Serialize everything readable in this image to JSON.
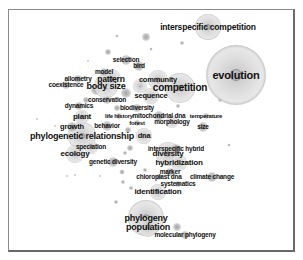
{
  "chart_data": {
    "type": "bubble-network",
    "title": "",
    "frame": {
      "x": 8,
      "y": 9,
      "width": 288,
      "height": 244
    },
    "colors": {
      "bubble_outer": "#e6e6e6",
      "bubble_inner": "#bdbdbd",
      "bubble_core": "#8c8c8c",
      "text": "#111111",
      "frame": "#7a7a7a"
    },
    "nodes": [
      {
        "label": "interspecific competition",
        "x": 208,
        "y": 27,
        "r": 13,
        "fs": 8.5
      },
      {
        "label": "evolution",
        "x": 236,
        "y": 75,
        "r": 30,
        "fs": 11
      },
      {
        "label": "competition",
        "x": 180,
        "y": 88,
        "r": 15,
        "fs": 10
      },
      {
        "label": "selection",
        "x": 126,
        "y": 60,
        "r": 5,
        "fs": 6.5
      },
      {
        "label": "bird",
        "x": 139,
        "y": 66,
        "r": 5,
        "fs": 6.5
      },
      {
        "label": "model",
        "x": 104,
        "y": 72,
        "r": 4,
        "fs": 6.5
      },
      {
        "label": "allometry",
        "x": 78,
        "y": 79,
        "r": 4,
        "fs": 6.5
      },
      {
        "label": "pattern",
        "x": 111,
        "y": 79,
        "r": 10,
        "fs": 8.5
      },
      {
        "label": "community",
        "x": 158,
        "y": 80,
        "r": 10,
        "fs": 7.5
      },
      {
        "label": "coexistence",
        "x": 66,
        "y": 85,
        "r": 4,
        "fs": 6.5
      },
      {
        "label": "body size",
        "x": 106,
        "y": 86,
        "r": 12,
        "fs": 9
      },
      {
        "label": "sequence",
        "x": 151,
        "y": 96,
        "r": 8,
        "fs": 7.5
      },
      {
        "label": "conservation",
        "x": 107,
        "y": 100,
        "r": 4,
        "fs": 6.5
      },
      {
        "label": "dynamics",
        "x": 79,
        "y": 106,
        "r": 4,
        "fs": 6.5
      },
      {
        "label": "biodiversity",
        "x": 137,
        "y": 108,
        "r": 4,
        "fs": 6.5
      },
      {
        "label": "plant",
        "x": 82,
        "y": 117,
        "r": 7,
        "fs": 8
      },
      {
        "label": "life history",
        "x": 119,
        "y": 116,
        "r": 3,
        "fs": 6
      },
      {
        "label": "mitochondrial dna",
        "x": 159,
        "y": 116,
        "r": 5,
        "fs": 6.5
      },
      {
        "label": "temperature",
        "x": 206,
        "y": 116,
        "r": 3,
        "fs": 6
      },
      {
        "label": "forest",
        "x": 137,
        "y": 123,
        "r": 3,
        "fs": 6
      },
      {
        "label": "morphology",
        "x": 172,
        "y": 122,
        "r": 6,
        "fs": 6.5
      },
      {
        "label": "behavior",
        "x": 107,
        "y": 126,
        "r": 5,
        "fs": 6.5
      },
      {
        "label": "size",
        "x": 203,
        "y": 127,
        "r": 5,
        "fs": 6.5
      },
      {
        "label": "growth",
        "x": 72,
        "y": 127,
        "r": 5,
        "fs": 7.5
      },
      {
        "label": "phylogenetic relationship",
        "x": 82,
        "y": 136,
        "r": 14,
        "fs": 9
      },
      {
        "label": "dna",
        "x": 144,
        "y": 136,
        "r": 8,
        "fs": 7.5
      },
      {
        "label": "speciation",
        "x": 91,
        "y": 147,
        "r": 7,
        "fs": 6.5
      },
      {
        "label": "interspecific hybrid",
        "x": 176,
        "y": 149,
        "r": 5,
        "fs": 6.5
      },
      {
        "label": "ecology",
        "x": 75,
        "y": 154,
        "r": 9,
        "fs": 8
      },
      {
        "label": "diversity",
        "x": 168,
        "y": 154,
        "r": 12,
        "fs": 8
      },
      {
        "label": "genetic diversity",
        "x": 113,
        "y": 162,
        "r": 5,
        "fs": 6.5
      },
      {
        "label": "hybridization",
        "x": 179,
        "y": 163,
        "r": 8,
        "fs": 8
      },
      {
        "label": "marker",
        "x": 170,
        "y": 172,
        "r": 4,
        "fs": 6.5
      },
      {
        "label": "chloroplast dna",
        "x": 159,
        "y": 177,
        "r": 3,
        "fs": 6.5
      },
      {
        "label": "climate change",
        "x": 212,
        "y": 177,
        "r": 5,
        "fs": 6.5
      },
      {
        "label": "systematics",
        "x": 178,
        "y": 184,
        "r": 3,
        "fs": 6.5
      },
      {
        "label": "identification",
        "x": 158,
        "y": 192,
        "r": 8,
        "fs": 8
      },
      {
        "label": "phylogeny",
        "x": 146,
        "y": 218,
        "r": 18,
        "fs": 9
      },
      {
        "label": "population",
        "x": 148,
        "y": 227,
        "r": 10,
        "fs": 9
      },
      {
        "label": "molecular phylogeny",
        "x": 185,
        "y": 235,
        "r": 4,
        "fs": 6.5
      }
    ],
    "extra_bubbles": [
      {
        "x": 146,
        "y": 37,
        "r": 4
      },
      {
        "x": 108,
        "y": 52,
        "r": 3
      },
      {
        "x": 182,
        "y": 43,
        "r": 2
      },
      {
        "x": 117,
        "y": 36,
        "r": 1.5
      },
      {
        "x": 151,
        "y": 49,
        "r": 1.5
      },
      {
        "x": 88,
        "y": 61,
        "r": 1
      },
      {
        "x": 140,
        "y": 86,
        "r": 7
      },
      {
        "x": 126,
        "y": 93,
        "r": 5
      },
      {
        "x": 96,
        "y": 90,
        "r": 5
      },
      {
        "x": 86,
        "y": 100,
        "r": 3
      },
      {
        "x": 117,
        "y": 108,
        "r": 3
      },
      {
        "x": 128,
        "y": 130,
        "r": 3
      },
      {
        "x": 130,
        "y": 148,
        "r": 3
      },
      {
        "x": 125,
        "y": 153,
        "r": 2
      },
      {
        "x": 122,
        "y": 172,
        "r": 2.5
      },
      {
        "x": 123,
        "y": 182,
        "r": 2
      },
      {
        "x": 131,
        "y": 188,
        "r": 2
      },
      {
        "x": 145,
        "y": 170,
        "r": 2
      },
      {
        "x": 178,
        "y": 106,
        "r": 2
      },
      {
        "x": 220,
        "y": 100,
        "r": 2
      },
      {
        "x": 229,
        "y": 145,
        "r": 1.5
      },
      {
        "x": 116,
        "y": 202,
        "r": 2
      },
      {
        "x": 177,
        "y": 227,
        "r": 4
      },
      {
        "x": 67,
        "y": 176,
        "r": 1
      },
      {
        "x": 75,
        "y": 175,
        "r": 1
      },
      {
        "x": 100,
        "y": 176,
        "r": 1
      },
      {
        "x": 37,
        "y": 119,
        "r": 1
      },
      {
        "x": 55,
        "y": 126,
        "r": 1
      },
      {
        "x": 82,
        "y": 112,
        "r": 1.5
      }
    ]
  }
}
